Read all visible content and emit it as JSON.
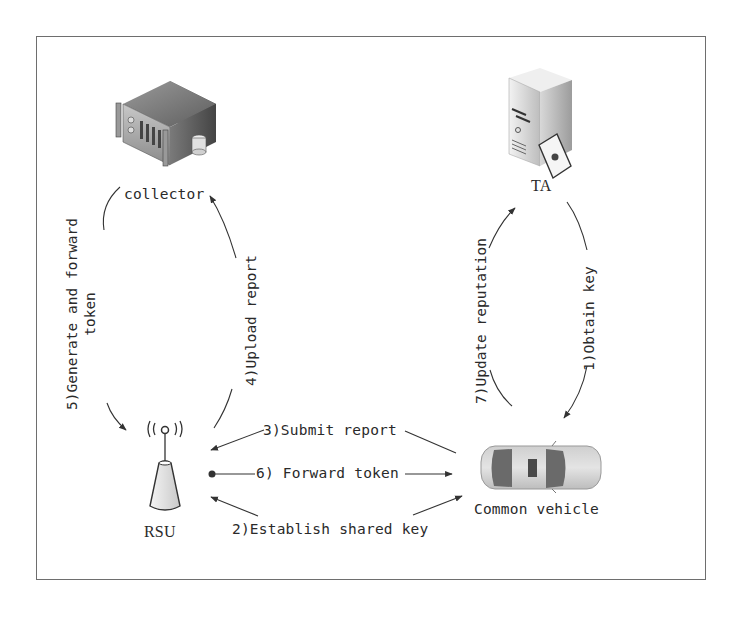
{
  "nodes": {
    "collector": {
      "label": "collector",
      "icon": "server-rack-icon"
    },
    "ta": {
      "label": "TA",
      "icon": "server-tower-certificate-icon"
    },
    "rsu": {
      "label": "RSU",
      "icon": "antenna-tower-icon"
    },
    "vehicle": {
      "label": "Common vehicle",
      "icon": "car-topview-icon"
    }
  },
  "edges": [
    {
      "id": "e1",
      "label": "1)Obtain key",
      "from": "TA",
      "to": "Common vehicle"
    },
    {
      "id": "e2",
      "label": "2)Establish shared key",
      "from": "RSU",
      "to": "Common vehicle",
      "bidirectional": true
    },
    {
      "id": "e3",
      "label": "3)Submit report",
      "from": "Common vehicle",
      "to": "RSU"
    },
    {
      "id": "e4",
      "label": "4)Upload report",
      "from": "RSU",
      "to": "collector"
    },
    {
      "id": "e5",
      "label_line1": "5)Generate and forward",
      "label_line2": "token",
      "from": "collector",
      "to": "RSU"
    },
    {
      "id": "e6",
      "label": "6) Forward token",
      "from": "RSU",
      "to": "Common vehicle"
    },
    {
      "id": "e7",
      "label": "7)Update reputation",
      "from": "Common vehicle",
      "to": "TA"
    }
  ],
  "colors": {
    "border": "#6e6e6e",
    "line": "#333333",
    "text": "#2a2a2a"
  }
}
